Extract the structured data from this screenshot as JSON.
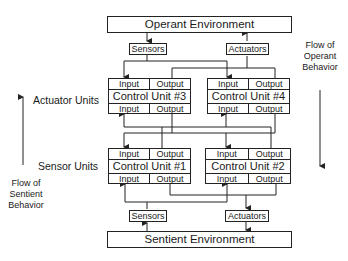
{
  "environments": {
    "operant": "Operant Environment",
    "sentient": "Sentient Environment"
  },
  "io_boxes": {
    "top_sensors": "Sensors",
    "top_actuators": "Actuators",
    "bottom_sensors": "Sensors",
    "bottom_actuators": "Actuators"
  },
  "control_units": [
    {
      "name": "Control Unit #3",
      "top_left": "Input",
      "top_right": "Output",
      "bottom_left": "Input",
      "bottom_right": "Output"
    },
    {
      "name": "Control Unit #4",
      "top_left": "Input",
      "top_right": "Output",
      "bottom_left": "Input",
      "bottom_right": "Output"
    },
    {
      "name": "Control Unit #1",
      "top_left": "Input",
      "top_right": "Output",
      "bottom_left": "Input",
      "bottom_right": "Output"
    },
    {
      "name": "Control Unit #2",
      "top_left": "Input",
      "top_right": "Output",
      "bottom_left": "Input",
      "bottom_right": "Output"
    }
  ],
  "row_labels": {
    "actuator_units": "Actuator Units",
    "sensor_units": "Sensor Units"
  },
  "flow_labels": {
    "sentient": [
      "Flow of",
      "Sentient",
      "Behavior"
    ],
    "operant": [
      "Flow of",
      "Operant",
      "Behavior"
    ]
  }
}
